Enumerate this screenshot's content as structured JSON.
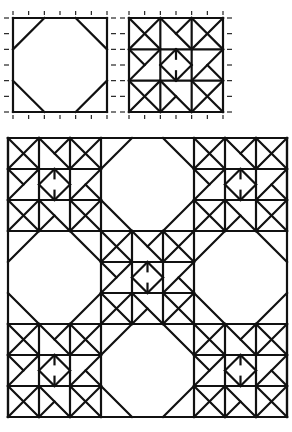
{
  "figure": {
    "stroke_color": "#111111",
    "background": "#ffffff"
  },
  "blocks": {
    "octagon_block": {
      "x": 13,
      "y": 18,
      "size": 94,
      "ticks_per_side": 6,
      "corner_cut": 0.33
    },
    "star_block": {
      "x": 129,
      "y": 18,
      "size": 94,
      "ticks_per_side": 6
    },
    "quilt": {
      "x": 8,
      "y": 138,
      "block_size": 93,
      "rows": 3,
      "cols": 3,
      "layout": [
        [
          "star",
          "octagon",
          "star"
        ],
        [
          "octagon",
          "star",
          "octagon"
        ],
        [
          "star",
          "octagon",
          "star"
        ]
      ]
    }
  }
}
